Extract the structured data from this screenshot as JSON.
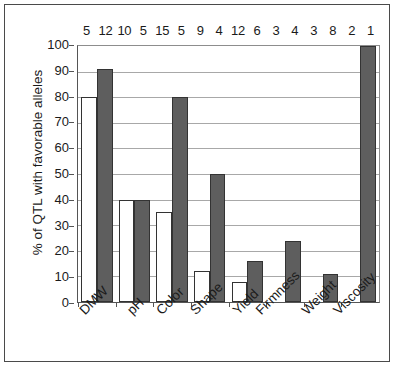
{
  "chart_data": {
    "type": "bar",
    "title": "",
    "xlabel": "",
    "ylabel": "% of QTL with favorable alleles",
    "ylim": [
      0,
      100
    ],
    "ytick_step": 10,
    "yticks": [
      100,
      90,
      80,
      70,
      60,
      50,
      40,
      30,
      20,
      10,
      0
    ],
    "grid": true,
    "legend_position": "none",
    "categories": [
      "DMW",
      "pH",
      "Color",
      "Shape",
      "Yield",
      "Firmness",
      "Weight",
      "Viscosity"
    ],
    "series": [
      {
        "name": "white",
        "color": "#ffffff",
        "values": [
          80,
          40,
          35,
          12,
          8,
          0,
          0,
          0
        ]
      },
      {
        "name": "gray",
        "color": "#5e5e5e",
        "values": [
          91,
          40,
          80,
          50,
          16,
          24,
          11,
          100
        ]
      }
    ],
    "top_counts": [
      [
        "5",
        "12"
      ],
      [
        "10",
        "5"
      ],
      [
        "15",
        "5"
      ],
      [
        "9",
        "4"
      ],
      [
        "12",
        "6"
      ],
      [
        "3",
        "4"
      ],
      [
        "3",
        "8"
      ],
      [
        "2",
        "1"
      ]
    ]
  }
}
